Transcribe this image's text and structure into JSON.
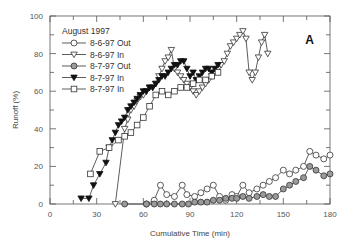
{
  "chart_data": {
    "type": "line",
    "title": "",
    "panel_label": "A",
    "xlabel": "Cumulative Time (min)",
    "ylabel": "Runoff (%)",
    "xlim": [
      0,
      180
    ],
    "ylim": [
      0,
      100
    ],
    "xticks": [
      0,
      30,
      60,
      90,
      120,
      150,
      180
    ],
    "yticks": [
      0,
      20,
      40,
      60,
      80,
      100
    ],
    "grid": false,
    "legend": {
      "title": "August 1997",
      "position": "upper left"
    },
    "series": [
      {
        "name": "8-6-97 Out",
        "marker": "circle-open",
        "x": [
          62,
          67,
          71,
          75,
          80,
          85,
          88,
          93,
          97,
          101,
          105,
          109,
          113,
          117,
          120,
          124,
          128,
          133,
          137,
          141,
          145,
          150,
          154,
          158,
          163,
          167,
          171,
          176,
          180
        ],
        "y": [
          0,
          2,
          10,
          5,
          4,
          10,
          5,
          4,
          6,
          8,
          10,
          4,
          2,
          5,
          4,
          10,
          6,
          8,
          10,
          12,
          14,
          18,
          16,
          18,
          20,
          28,
          26,
          24,
          26
        ]
      },
      {
        "name": "8-6-97 In",
        "marker": "triangle-down-open",
        "x": [
          42,
          48,
          50,
          52,
          54,
          56,
          58,
          60,
          62,
          64,
          66,
          68,
          70,
          72,
          74,
          76,
          78,
          80,
          82,
          84,
          86,
          88,
          90,
          92,
          94,
          96,
          98,
          100,
          102,
          104,
          106,
          108,
          110,
          112,
          114,
          116,
          118,
          120,
          122,
          124,
          126,
          128,
          130,
          132,
          134,
          136,
          138,
          140
        ],
        "y": [
          0,
          40,
          45,
          50,
          52,
          55,
          57,
          58,
          60,
          62,
          62,
          64,
          68,
          72,
          76,
          78,
          82,
          72,
          70,
          68,
          66,
          64,
          62,
          60,
          58,
          60,
          62,
          64,
          66,
          68,
          70,
          72,
          74,
          76,
          80,
          84,
          86,
          88,
          90,
          92,
          88,
          70,
          66,
          70,
          78,
          86,
          90,
          80
        ]
      },
      {
        "name": "8-7-97 Out",
        "marker": "circle-gray",
        "x": [
          48,
          62,
          67,
          71,
          75,
          80,
          85,
          89,
          93,
          97,
          101,
          105,
          109,
          113,
          117,
          120,
          124,
          128,
          133,
          137,
          141,
          145,
          150,
          154,
          158,
          163,
          167,
          171,
          176,
          180
        ],
        "y": [
          0,
          0,
          0,
          0,
          0,
          0,
          0,
          0,
          1,
          1,
          1,
          2,
          2,
          3,
          3,
          3,
          4,
          3,
          4,
          5,
          4,
          4,
          8,
          10,
          12,
          14,
          20,
          18,
          15,
          16
        ]
      },
      {
        "name": "8-7-97 In",
        "marker": "triangle-down-filled",
        "x": [
          20,
          25,
          28,
          32,
          36,
          38,
          40,
          42,
          44,
          46,
          48,
          50,
          52,
          54,
          56,
          58,
          60,
          62,
          64,
          66,
          68,
          70,
          72,
          74,
          76,
          78,
          80,
          82,
          84,
          86,
          88,
          90,
          92,
          94,
          96,
          98,
          100,
          102,
          104,
          106,
          108
        ],
        "y": [
          3,
          3,
          10,
          16,
          22,
          30,
          34,
          38,
          42,
          44,
          46,
          50,
          52,
          54,
          56,
          58,
          60,
          60,
          62,
          62,
          64,
          66,
          68,
          68,
          70,
          72,
          74,
          74,
          76,
          76,
          72,
          68,
          70,
          66,
          68,
          70,
          72,
          72,
          70,
          72,
          74
        ]
      },
      {
        "name": "8-7-97 In",
        "marker": "square-open",
        "x": [
          26,
          32,
          38,
          44,
          48,
          52,
          56,
          60,
          64,
          68,
          72,
          76,
          80,
          84,
          88,
          92,
          96,
          100,
          104,
          108
        ],
        "y": [
          16,
          28,
          30,
          34,
          36,
          38,
          42,
          46,
          52,
          58,
          60,
          58,
          60,
          62,
          62,
          64,
          66,
          66,
          68,
          70
        ]
      }
    ]
  }
}
